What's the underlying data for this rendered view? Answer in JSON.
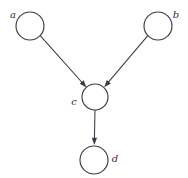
{
  "figure": {
    "kind": "directed-acyclic-graph",
    "title": "",
    "background_color": "#ffffff",
    "stroke_color": "#3a3a44",
    "label_color": "#2e2e36",
    "node_fill": "#ffffff"
  },
  "nodes": [
    {
      "id": "a",
      "label": "a",
      "cx": 30,
      "cy": 26,
      "r": 14,
      "label_x": 13,
      "label_y": 15,
      "label_anchor": "middle"
    },
    {
      "id": "b",
      "label": "b",
      "cx": 158,
      "cy": 26,
      "r": 14,
      "label_x": 176,
      "label_y": 15,
      "label_anchor": "middle"
    },
    {
      "id": "c",
      "label": "c",
      "cx": 95,
      "cy": 97,
      "r": 13,
      "label_x": 74,
      "label_y": 102,
      "label_anchor": "middle"
    },
    {
      "id": "d",
      "label": "d",
      "cx": 94,
      "cy": 160,
      "r": 14,
      "label_x": 115,
      "label_y": 159,
      "label_anchor": "middle"
    }
  ],
  "edges": [
    {
      "id": "a-to-c",
      "from": "a",
      "to": "c",
      "directed": true,
      "x1": 40.2,
      "y1": 35.6,
      "x2": 86.5,
      "y2": 87.4,
      "arrow_angle": 48.2
    },
    {
      "id": "b-to-c",
      "from": "b",
      "to": "c",
      "directed": true,
      "x1": 147.8,
      "y1": 35.6,
      "x2": 104.2,
      "y2": 87.2,
      "arrow_angle": 130.2
    },
    {
      "id": "c-to-d",
      "from": "c",
      "to": "d",
      "directed": true,
      "x1": 95,
      "y1": 110,
      "x2": 94.3,
      "y2": 145,
      "arrow_angle": 91
    }
  ],
  "arrow": {
    "length": 7.2,
    "half_width": 2.6
  }
}
